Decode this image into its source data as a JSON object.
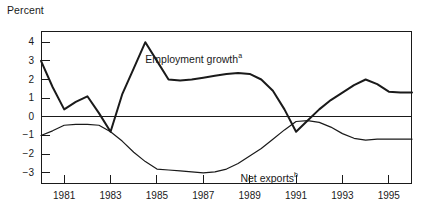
{
  "chart_data": {
    "type": "line",
    "title": "",
    "subtitle": "",
    "ylabel": "Percent",
    "xlabel": "",
    "xlim": [
      1980.0,
      1996.0
    ],
    "ylim": [
      -3.6,
      4.6
    ],
    "grid": false,
    "legend_position": "inline-annotations",
    "ytick_labels": [
      "4",
      "3",
      "2",
      "1",
      "0",
      "−1",
      "−2",
      "−3"
    ],
    "ytick_values": [
      4,
      3,
      2,
      1,
      0,
      -1,
      -2,
      -3
    ],
    "xtick_labels": [
      "1981",
      "1983",
      "1985",
      "1987",
      "1989",
      "1991",
      "1993",
      "1995"
    ],
    "xtick_values": [
      1981,
      1983,
      1985,
      1987,
      1989,
      1991,
      1993,
      1995
    ],
    "zero_line": 0,
    "annotations": [
      {
        "name": "employment-growth-label",
        "text": "Employment growth",
        "superscript": "a",
        "x": 1984.5,
        "y": 3.1
      },
      {
        "name": "net-exports-label",
        "text": "Net exports",
        "superscript": "b",
        "x": 1988.6,
        "y": -3.3
      }
    ],
    "x": [
      1980.0,
      1980.5,
      1981.0,
      1981.5,
      1982.0,
      1982.5,
      1983.0,
      1983.5,
      1984.0,
      1984.5,
      1985.0,
      1985.5,
      1986.0,
      1986.5,
      1987.0,
      1987.5,
      1988.0,
      1988.5,
      1989.0,
      1989.5,
      1990.0,
      1990.5,
      1991.0,
      1991.5,
      1992.0,
      1992.5,
      1993.0,
      1993.5,
      1994.0,
      1994.5,
      1995.0,
      1995.5,
      1996.0
    ],
    "series": [
      {
        "name": "Employment growth",
        "superscript": "a",
        "color": "#1a1a1a",
        "values": [
          3.0,
          1.6,
          0.4,
          0.8,
          1.1,
          0.2,
          -0.8,
          1.2,
          2.6,
          4.0,
          3.0,
          2.0,
          1.95,
          2.0,
          2.1,
          2.2,
          2.3,
          2.35,
          2.3,
          2.0,
          1.4,
          0.4,
          -0.8,
          -0.2,
          0.4,
          0.9,
          1.3,
          1.7,
          2.0,
          1.75,
          1.35,
          1.3,
          1.3
        ]
      },
      {
        "name": "Net exports",
        "superscript": "b",
        "color": "#1a1a1a",
        "values": [
          -1.0,
          -0.75,
          -0.45,
          -0.4,
          -0.4,
          -0.45,
          -0.8,
          -1.3,
          -1.9,
          -2.4,
          -2.8,
          -2.85,
          -2.9,
          -2.95,
          -3.0,
          -2.95,
          -2.8,
          -2.5,
          -2.1,
          -1.7,
          -1.2,
          -0.7,
          -0.25,
          -0.2,
          -0.3,
          -0.55,
          -0.9,
          -1.15,
          -1.25,
          -1.2,
          -1.2,
          -1.2,
          -1.2
        ]
      }
    ]
  }
}
